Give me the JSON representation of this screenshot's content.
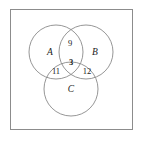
{
  "diagram": {
    "type": "venn-3-set",
    "title": "",
    "frame": {
      "name": "outer-border"
    },
    "sets": [
      {
        "id": "A",
        "label": "A",
        "cx": 56,
        "cy": 52,
        "r": 27
      },
      {
        "id": "B",
        "label": "B",
        "cx": 86,
        "cy": 52,
        "r": 27
      },
      {
        "id": "C",
        "label": "C",
        "cx": 71,
        "cy": 89,
        "r": 27
      }
    ],
    "region_counts": [
      {
        "id": "AB",
        "value": "9",
        "x": 70,
        "y": 44
      },
      {
        "id": "ABC",
        "value": "3",
        "x": 71,
        "y": 63,
        "bold": true
      },
      {
        "id": "AC",
        "value": "11",
        "x": 56,
        "y": 72
      },
      {
        "id": "BC",
        "value": "12",
        "x": 87,
        "y": 72
      }
    ],
    "labels": {
      "set_a": "A",
      "set_b": "B",
      "set_c": "C",
      "count_ab": "9",
      "count_abc": "3",
      "count_ac": "11",
      "count_bc": "12"
    },
    "colors": {
      "stroke": "#8a8a8a",
      "frame": "#8c8c8c",
      "text": "#1a1a1a",
      "background": "#ffffff"
    }
  }
}
